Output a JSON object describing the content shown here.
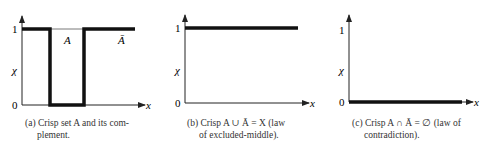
{
  "panels": [
    {
      "id": "a",
      "labels": {
        "one": "1",
        "chi": "χ",
        "zero": "0",
        "x": "x",
        "A": "A",
        "Abar": "Ā"
      },
      "caption_line1": "(a) Crisp set A and its com-",
      "caption_line2": "plement."
    },
    {
      "id": "b",
      "labels": {
        "one": "1",
        "chi": "χ",
        "zero": "0",
        "x": "x"
      },
      "caption_line1": "(b) Crisp A ∪ Ā = X (law",
      "caption_line2": "of excluded-middle)."
    },
    {
      "id": "c",
      "labels": {
        "one": "1",
        "chi": "χ",
        "zero": "0",
        "x": "x"
      },
      "caption_line1": "(c) Crisp A ∩ Ā = ∅ (law of",
      "caption_line2": "contradiction)."
    }
  ],
  "colors": {
    "ink": "#111111",
    "axis": "#222222"
  }
}
